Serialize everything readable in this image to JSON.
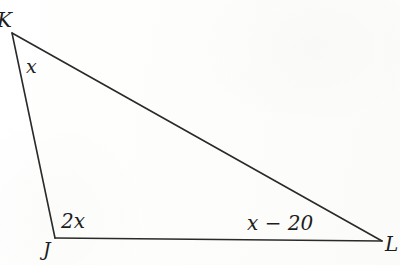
{
  "figure": {
    "kind": "triangle-angle-diagram",
    "background_color": "#fdfdfc",
    "stroke_color": "#2a2a2a",
    "text_color": "#1d1d1d",
    "vertices": {
      "apex": {
        "name": "K",
        "x": 12,
        "y": 33
      },
      "bottom_left": {
        "name": "J",
        "x": 55,
        "y": 238
      },
      "bottom_right": {
        "name": "L",
        "x": 382,
        "y": 241
      }
    },
    "sides": [
      {
        "name": "side-apex-to-j",
        "from": "apex",
        "to": "bottom_left"
      },
      {
        "name": "side-apex-to-l",
        "from": "apex",
        "to": "bottom_right"
      },
      {
        "name": "side-j-to-l",
        "from": "bottom_left",
        "to": "bottom_right"
      }
    ]
  },
  "vertex_labels": {
    "apex": "K",
    "bottom_left": "J",
    "bottom_right": "L"
  },
  "angle_labels": {
    "apex": "x",
    "bottom_left": "2x",
    "bottom_right": "x − 20"
  }
}
